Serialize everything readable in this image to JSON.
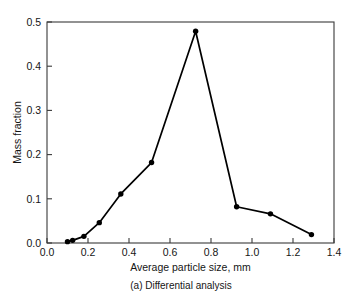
{
  "chart_data": {
    "type": "line",
    "title": "",
    "caption": "(a) Differential analysis",
    "xlabel": "Average particle size, mm",
    "ylabel": "Mass fraction",
    "xlim": [
      0.0,
      1.4
    ],
    "ylim": [
      0.0,
      0.5
    ],
    "grid": false,
    "legend": "none",
    "marker": "filled-circle",
    "xticks": [
      "0.0",
      "0.2",
      "0.4",
      "0.6",
      "0.8",
      "1.0",
      "1.2",
      "1.4"
    ],
    "xtick_values": [
      0.0,
      0.2,
      0.4,
      0.6,
      0.8,
      1.0,
      1.2,
      1.4
    ],
    "yticks": [
      "0.0",
      "0.1",
      "0.2",
      "0.3",
      "0.4",
      "0.5"
    ],
    "ytick_values": [
      0.0,
      0.1,
      0.2,
      0.3,
      0.4,
      0.5
    ],
    "x": [
      0.1,
      0.125,
      0.18,
      0.255,
      0.36,
      0.51,
      0.725,
      0.925,
      1.09,
      1.29
    ],
    "values": [
      0.003,
      0.006,
      0.015,
      0.046,
      0.111,
      0.182,
      0.479,
      0.082,
      0.066,
      0.019
    ],
    "series": [
      {
        "name": "Mass fraction",
        "points": [
          {
            "x": 0.1,
            "y": 0.003
          },
          {
            "x": 0.125,
            "y": 0.006
          },
          {
            "x": 0.18,
            "y": 0.015
          },
          {
            "x": 0.255,
            "y": 0.046
          },
          {
            "x": 0.36,
            "y": 0.111
          },
          {
            "x": 0.51,
            "y": 0.182
          },
          {
            "x": 0.725,
            "y": 0.479
          },
          {
            "x": 0.925,
            "y": 0.082
          },
          {
            "x": 1.09,
            "y": 0.066
          },
          {
            "x": 1.29,
            "y": 0.019
          }
        ]
      }
    ]
  },
  "colors": {
    "line": "#000000",
    "marker": "#000000",
    "axis": "#3a3a3a",
    "text": "#151515",
    "background": "#ffffff"
  }
}
